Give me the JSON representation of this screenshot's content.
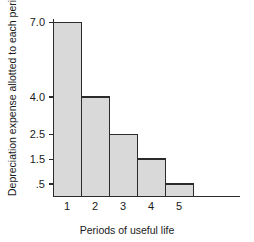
{
  "chart_data": {
    "type": "bar",
    "title": "",
    "subtitle": "",
    "categories": [
      "1",
      "2",
      "3",
      "4",
      "5"
    ],
    "values": [
      7.0,
      4.0,
      2.5,
      1.5,
      0.5
    ],
    "xlabel": "Periods of useful life",
    "ylabel": "Depreciation expense allotted to each period",
    "ytick_labels": [
      "7.0",
      "4.0",
      "2.5",
      "1.5",
      ".5"
    ],
    "ytick_values": [
      7.0,
      4.0,
      2.5,
      1.5,
      0.5
    ],
    "xtick_labels": [
      "1",
      "2",
      "3",
      "4",
      "5"
    ],
    "ylim": [
      0,
      7.0
    ],
    "grid": false,
    "legend": null,
    "legend_position": "none",
    "annotations": []
  },
  "style": {
    "background_color": "#ffffff",
    "bar_fill_color": "#d9d9d9",
    "bar_edge_color": "#2b2b2b",
    "axis_color": "#2b2b2b",
    "text_color": "#1a1a1a"
  },
  "geometry": {
    "plot_left": 53,
    "plot_right": 193,
    "axis_right_end": 240,
    "plot_top": 22,
    "plot_bottom": 196,
    "bar_width": 28
  }
}
